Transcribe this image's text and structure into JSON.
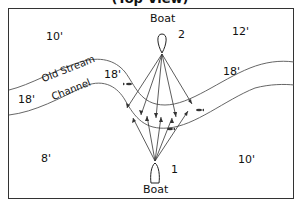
{
  "title": "(Top View)",
  "boats": [
    {
      "id": "boat-2",
      "label": "Boat",
      "number": "2"
    },
    {
      "id": "boat-1",
      "label": "Boat",
      "number": "1"
    }
  ],
  "depths": {
    "top_left": "10'",
    "top_right": "12'",
    "bottom_left": "8'",
    "bottom_right": "10'",
    "channel_left": "18'",
    "channel_mid": "18'",
    "channel_right": "18'"
  },
  "channel_label": {
    "line1": "Old Stream",
    "line2": "Channel"
  },
  "colors": {
    "line": "#333333",
    "text": "#111111",
    "background": "#ffffff"
  }
}
